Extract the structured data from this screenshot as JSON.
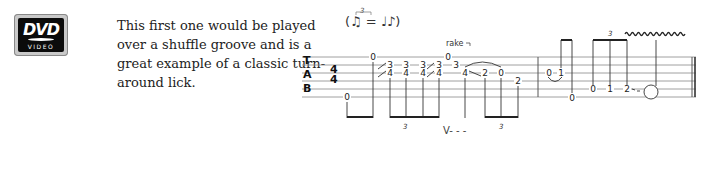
{
  "logo": {
    "brand": "DVD",
    "sub": "VIDEO"
  },
  "description": {
    "lines": [
      "This first one would be played",
      "over a shuffle groove and is a",
      "great example of a classic turn-",
      "around lick."
    ]
  },
  "notation": {
    "swing_marking": "(♫ = ♩♪)",
    "swing_triplet": "3",
    "clef": [
      "T",
      "A",
      "B"
    ],
    "time_signature": {
      "top": "4",
      "bottom": "4"
    },
    "rake_label": "rake",
    "triplet_labels": [
      "3",
      "3",
      "3"
    ],
    "pick_marking": "V- - -",
    "fret_numbers": {
      "m1_bass": "0",
      "m1_high": "0",
      "dbl1_top": "3",
      "dbl1_bot": "4",
      "dbl2_top": "3",
      "dbl2_bot": "4",
      "dbl3_top": "3",
      "dbl3_bot": "4",
      "dbl4_top": "3",
      "dbl4_bot": "4",
      "rake_top": "0",
      "n_3": "3",
      "n_4": "4",
      "n_2a": "2",
      "n_0": "0",
      "n_2b": "2",
      "m2_0": "0",
      "m2_1": "1",
      "m2_bass": "0",
      "m2_r0": "0",
      "m2_r1": "1",
      "m2_r2": "2"
    }
  }
}
